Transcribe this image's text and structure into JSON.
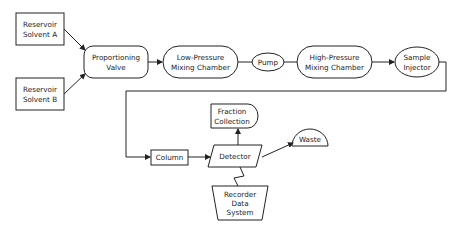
{
  "diagram": {
    "type": "flowchart",
    "nodes": {
      "reservoir_a": {
        "line1": "Reservoir",
        "line2": "Solvent A"
      },
      "reservoir_b": {
        "line1": "Reservoir",
        "line2": "Solvent B"
      },
      "proportioning_valve": {
        "line1": "Proportioning",
        "line2": "Valve"
      },
      "low_pressure": {
        "line1": "Low-Pressure",
        "line2": "Mixing Chamber"
      },
      "pump": {
        "line1": "Pump"
      },
      "high_pressure": {
        "line1": "High-Pressure",
        "line2": "Mixing Chamber"
      },
      "sample_injector": {
        "line1": "Sample",
        "line2": "Injector"
      },
      "column": {
        "line1": "Column"
      },
      "detector": {
        "line1": "Detector"
      },
      "fraction_collection": {
        "line1": "Fraction",
        "line2": "Collection"
      },
      "waste": {
        "line1": "Waste"
      },
      "recorder": {
        "line1": "Recorder",
        "line2": "Data",
        "line3": "System"
      }
    },
    "edges": [
      {
        "from": "Reservoir Solvent A",
        "to": "Proportioning Valve"
      },
      {
        "from": "Reservoir Solvent B",
        "to": "Proportioning Valve"
      },
      {
        "from": "Proportioning Valve",
        "to": "Low-Pressure Mixing Chamber"
      },
      {
        "from": "Low-Pressure Mixing Chamber",
        "to": "Pump"
      },
      {
        "from": "Pump",
        "to": "High-Pressure Mixing Chamber"
      },
      {
        "from": "High-Pressure Mixing Chamber",
        "to": "Sample Injector"
      },
      {
        "from": "Sample Injector",
        "to": "Column"
      },
      {
        "from": "Column",
        "to": "Detector"
      },
      {
        "from": "Detector",
        "to": "Fraction Collection"
      },
      {
        "from": "Detector",
        "to": "Waste"
      },
      {
        "from": "Detector",
        "to": "Recorder Data System",
        "style": "zigzag"
      }
    ]
  }
}
